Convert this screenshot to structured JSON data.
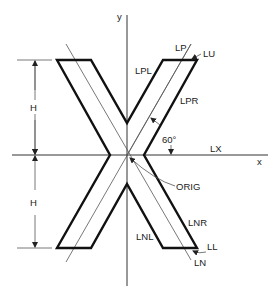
{
  "figure": {
    "axes": {
      "x_label": "x",
      "y_label": "y"
    },
    "labels": {
      "lp": "LP",
      "lu": "LU",
      "lpl": "LPL",
      "lpr": "LPR",
      "angle": "60°",
      "lx": "LX",
      "orig": "ORIG",
      "lnr": "LNR",
      "lnl": "LNL",
      "ll": "LL",
      "ln": "LN"
    },
    "dimensions": {
      "upper": "H",
      "lower": "H"
    },
    "colors": {
      "outline": "#111111",
      "thin": "#555555",
      "background": "#ffffff"
    }
  }
}
